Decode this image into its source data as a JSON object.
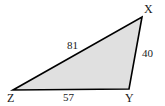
{
  "figure": {
    "type": "triangle-diagram",
    "background_color": "#ffffff",
    "fill_color": "#e0e0e0",
    "stroke_color": "#000000",
    "vertices": [
      {
        "name": "X",
        "label": "X",
        "x": 142,
        "y": 17
      },
      {
        "name": "Y",
        "label": "Y",
        "x": 129,
        "y": 89
      },
      {
        "name": "Z",
        "label": "Z",
        "x": 13,
        "y": 90
      }
    ],
    "sides": [
      {
        "name": "ZX",
        "label": "81",
        "from": "Z",
        "to": "X"
      },
      {
        "name": "XY",
        "label": "40",
        "from": "X",
        "to": "Y"
      },
      {
        "name": "ZY",
        "label": "57",
        "from": "Z",
        "to": "Y"
      }
    ],
    "labels": {
      "vertex_x": "X",
      "vertex_y": "Y",
      "vertex_z": "Z",
      "side_zx": "81",
      "side_xy": "40",
      "side_zy": "57"
    }
  }
}
